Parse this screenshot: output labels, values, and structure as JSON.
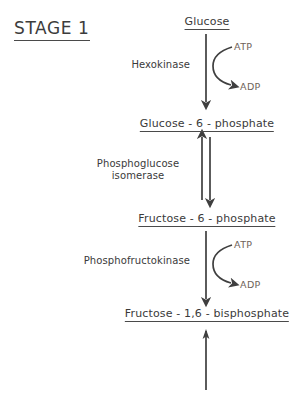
{
  "diagram": {
    "title": "STAGE 1",
    "pathway_name": "Glycolysis Stage 1",
    "background_color": "#ffffff",
    "ink_color": "#3a3a3a",
    "cofactor_color": "#6e6258"
  },
  "metabolites": [
    {
      "id": "glucose",
      "label": "Glucose",
      "x": 207,
      "y": 16
    },
    {
      "id": "glucose-6-phosphate",
      "label": "Glucose - 6 - phosphate",
      "x": 207,
      "y": 118
    },
    {
      "id": "fructose-6-phosphate",
      "label": "Fructose - 6 - phosphate",
      "x": 207,
      "y": 213
    },
    {
      "id": "fructose-1-6-bisphosphate",
      "label": "Fructose - 1,6 - bisphosphate",
      "x": 207,
      "y": 308
    }
  ],
  "enzymes": [
    {
      "id": "hexokinase",
      "label": "Hexokinase",
      "lines": [
        "Hexokinase"
      ],
      "x": 190,
      "y": 60
    },
    {
      "id": "phosphoglucose-isomerase",
      "label": "Phosphoglucose isomerase",
      "lines": [
        "Phosphoglucose",
        "isomerase"
      ],
      "x": 190,
      "y": 158
    },
    {
      "id": "phosphofructokinase",
      "label": "Phosphofructokinase",
      "lines": [
        "Phosphofructokinase"
      ],
      "x": 190,
      "y": 256
    }
  ],
  "cofactors": [
    {
      "id": "atp-hexokinase",
      "label": "ATP",
      "role": "substrate",
      "x": 234,
      "y": 42
    },
    {
      "id": "adp-hexokinase",
      "label": "ADP",
      "role": "product",
      "x": 240,
      "y": 82
    },
    {
      "id": "atp-pfk",
      "label": "ATP",
      "role": "substrate",
      "x": 234,
      "y": 240
    },
    {
      "id": "adp-pfk",
      "label": "ADP",
      "role": "product",
      "x": 240,
      "y": 280
    }
  ],
  "reactions": [
    {
      "id": "hexokinase-reaction",
      "from": "glucose",
      "to": "glucose-6-phosphate",
      "enzyme": "Hexokinase",
      "reversible": false,
      "direction": "down",
      "consumes": "ATP",
      "produces": "ADP"
    },
    {
      "id": "phosphoglucose-isomerase-reaction",
      "from": "glucose-6-phosphate",
      "to": "fructose-6-phosphate",
      "enzyme": "Phosphoglucose isomerase",
      "reversible": true,
      "direction": "both",
      "consumes": "",
      "produces": ""
    },
    {
      "id": "phosphofructokinase-reaction",
      "from": "fructose-6-phosphate",
      "to": "fructose-1-6-bisphosphate",
      "enzyme": "Phosphofructokinase",
      "reversible": false,
      "direction": "down",
      "consumes": "ATP",
      "produces": "ADP"
    },
    {
      "id": "continuation-reaction",
      "from": "fructose-1-6-bisphosphate",
      "to": "",
      "enzyme": "",
      "reversible": false,
      "direction": "continues",
      "consumes": "",
      "produces": ""
    }
  ]
}
